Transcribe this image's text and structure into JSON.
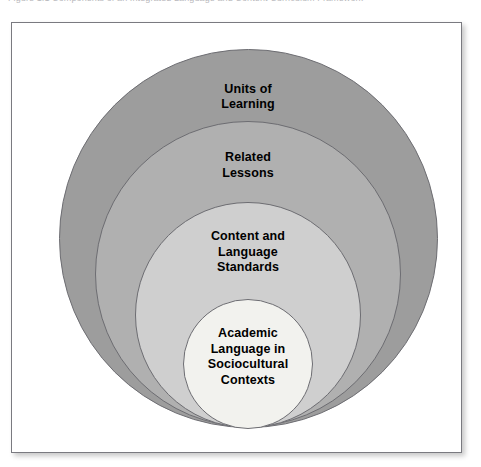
{
  "caption": {
    "text": "Figure 1.1   Components of an Integrated Language and Content Curriculum Framework",
    "visible_note": "partially cropped at top edge"
  },
  "figure": {
    "background": "#ffffff",
    "border_color": "#7a7a80"
  },
  "diagram": {
    "type": "nested-concentric-circles",
    "orientation": "bottom-aligned nested circles, largest at back",
    "rings": [
      {
        "id": "ring-1",
        "label": "Units of\nLearning",
        "fill": "#9d9d9d",
        "stroke": "#6d6d72",
        "cx": 236,
        "cy": 215,
        "diameter": 379,
        "label_offset_y": 32,
        "level": 1
      },
      {
        "id": "ring-2",
        "label": "Related\nLessons",
        "fill": "#b0b0b0",
        "stroke": "#6d6d72",
        "cx": 236,
        "cy": 251,
        "diameter": 306,
        "label_offset_y": 28,
        "level": 2
      },
      {
        "id": "ring-3",
        "label": "Content and\nLanguage\nStandards",
        "fill": "#cfcfcf",
        "stroke": "#6d6d72",
        "cx": 236,
        "cy": 292,
        "diameter": 226,
        "label_offset_y": 26,
        "level": 3
      },
      {
        "id": "ring-4",
        "label": "Academic\nLanguage in\nSociocultural\nContexts",
        "fill": "#f2f2ee",
        "stroke": "#6d6d72",
        "cx": 236,
        "cy": 341,
        "diameter": 130,
        "label_offset_y": 26,
        "level": 4
      }
    ]
  }
}
